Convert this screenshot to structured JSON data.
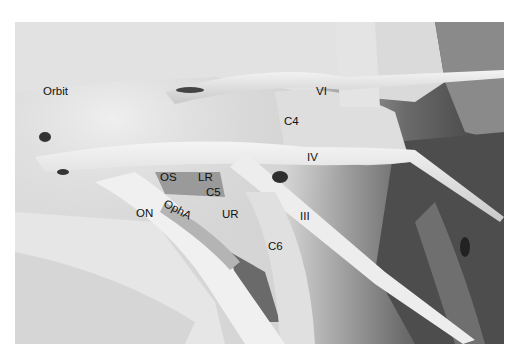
{
  "figure": {
    "type": "grayscale anatomical dissection photograph",
    "labels": [
      {
        "id": "orbit",
        "text": "Orbit",
        "x": 43,
        "y": 92
      },
      {
        "id": "vi",
        "text": "VI",
        "x": 316,
        "y": 86
      },
      {
        "id": "c4",
        "text": "C4",
        "x": 285,
        "y": 116
      },
      {
        "id": "iv",
        "text": "IV",
        "x": 307,
        "y": 152
      },
      {
        "id": "os",
        "text": "OS",
        "x": 160,
        "y": 172
      },
      {
        "id": "lr",
        "text": "LR",
        "x": 198,
        "y": 172
      },
      {
        "id": "c5",
        "text": "C5",
        "x": 206,
        "y": 186
      },
      {
        "id": "opha",
        "text": "OphA",
        "x": 167,
        "y": 196,
        "rotate": 28
      },
      {
        "id": "on",
        "text": "ON",
        "x": 136,
        "y": 208
      },
      {
        "id": "ur",
        "text": "UR",
        "x": 222,
        "y": 209
      },
      {
        "id": "iii",
        "text": "III",
        "x": 300,
        "y": 211
      },
      {
        "id": "c6",
        "text": "C6",
        "x": 268,
        "y": 242
      }
    ]
  }
}
